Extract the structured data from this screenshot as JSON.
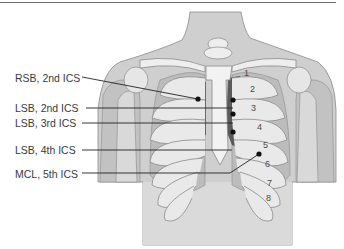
{
  "figure": {
    "labels": [
      {
        "id": "rsb2",
        "text": "RSB, 2nd ICS"
      },
      {
        "id": "lsb2",
        "text": "LSB, 2nd ICS"
      },
      {
        "id": "lsb3",
        "text": "LSB, 3rd ICS"
      },
      {
        "id": "lsb4",
        "text": "LSB, 4th ICS"
      },
      {
        "id": "mcl5",
        "text": "MCL, 5th ICS"
      }
    ],
    "rib_numbers": [
      "1",
      "2",
      "3",
      "4",
      "5",
      "6",
      "7",
      "8"
    ],
    "colors": {
      "skin": "#c9c9c9",
      "skin_light": "#dcdcdc",
      "bone": "#ececec",
      "lung": "#bdbdbd",
      "heart": "#5a5a5a",
      "outline": "#7a7a7a",
      "leader": "#222222"
    }
  }
}
